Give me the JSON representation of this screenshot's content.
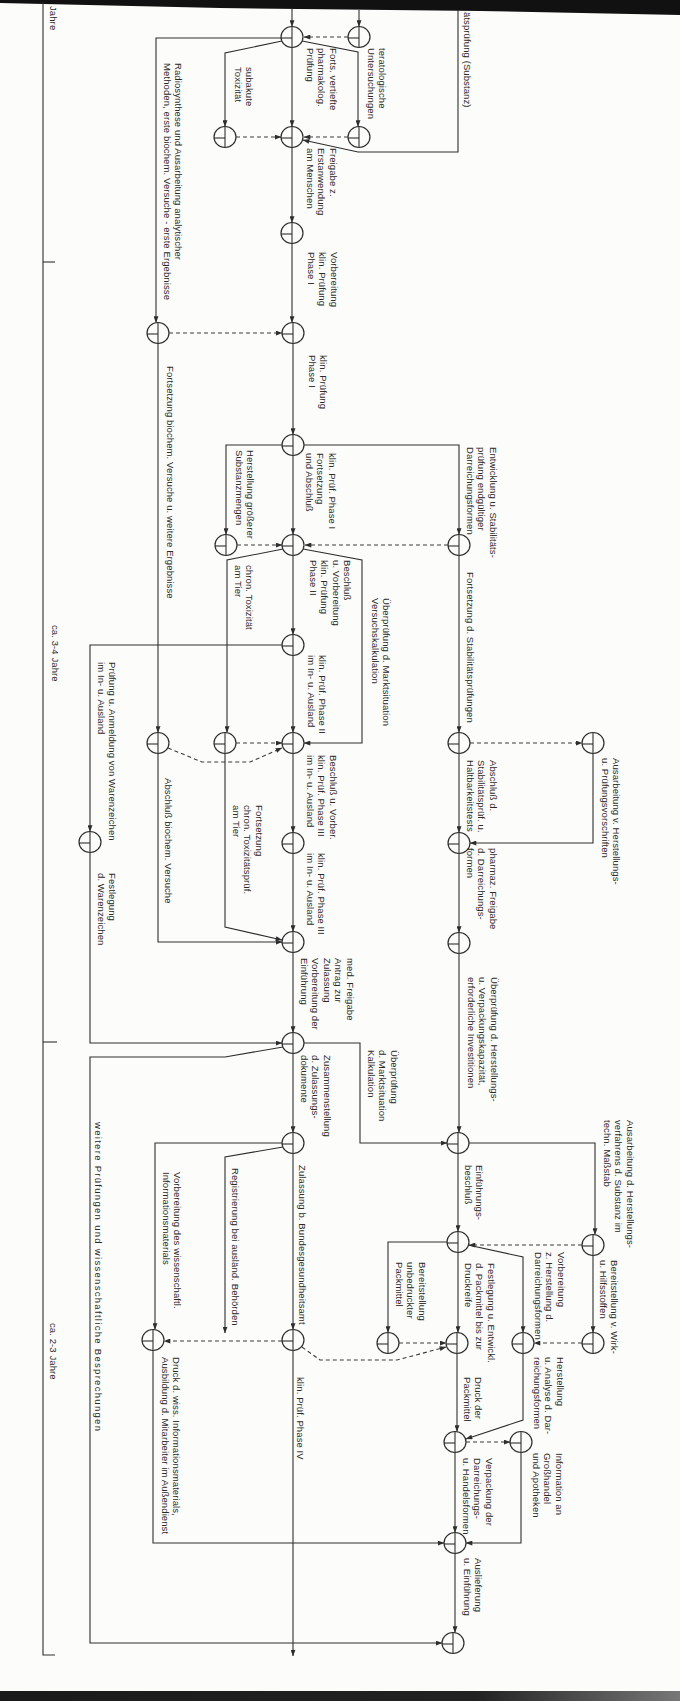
{
  "axis": {
    "unit_label": "Jahre",
    "period_1": "ca. 3-4 Jahre",
    "period_2": "ca. 2-3 Jahre"
  },
  "activities": [
    {
      "label": "ätsprüfung (Substanz)"
    },
    {
      "label": "teratologische\nUntersuchungen"
    },
    {
      "label": "Forts. vertiefte\npharmakolog.\nPrüfung"
    },
    {
      "label": "subakute\nToxizität"
    },
    {
      "label": "Radiosynthese und Ausarbeitung analytischer\nMethoden, erste biochem. Versuche - erste Ergebnisse"
    },
    {
      "label": "Freigabe z.\nErstanwendung\nam Menschen"
    },
    {
      "label": "Vorbereitung\nklin. Prüfung\nPhase I"
    },
    {
      "label": "klin. Prüfung\nPhase I"
    },
    {
      "label": "Fortsetzung biochem. Versuche u. weitere Ergebnisse"
    },
    {
      "label": "Entwicklung u. Stabilitäts-\nprüfung endgültiger\nDarreichungsformen"
    },
    {
      "label": "Herstellung größerer\nSubstanzmengen"
    },
    {
      "label": "klin. Prüf. Phase I\nFortsetzung\nund Abschluß"
    },
    {
      "label": "Fortsetzung d. Stabilitätsprüfungen"
    },
    {
      "label": "Beschluß\nu. Vorbereitung\nklin. Prüfung\nPhase II"
    },
    {
      "label": "Überprüfung d. Marktsituation\nVersuchskalkulation"
    },
    {
      "label": "chron. Toxizität\nam Tier"
    },
    {
      "label": "klin. Prüf. Phase II\nim In- u. Ausland"
    },
    {
      "label": "Prüfung u. Anmeldung von Warenzeichen\nim In- u. Ausland"
    },
    {
      "label": "Ausarbeitung v. Herstellungs-\nu. Prüfungsvorschriften"
    },
    {
      "label": "Abschluß d.\nStabilitätsprüf. u.\nHaltbarkeitstests"
    },
    {
      "label": "Beschluß u. Vorber.\nklin. Prüf. Phase III\nim In- u. Ausland"
    },
    {
      "label": "Abschluß biochem. Versuche"
    },
    {
      "label": "Fortsetzung\nchron. Toxizitätsprüf.\nam Tier"
    },
    {
      "label": "klin. Prüf. Phase III\nim In- u. Ausland"
    },
    {
      "label": "Festlegung\nd. Warenzeichen"
    },
    {
      "label": "pharmaz. Freigabe\nd. Darreichungs-\nformen"
    },
    {
      "label": "med. Freigabe\nAntrag zur\nZulassung\nVorbereitung der\nEinführung"
    },
    {
      "label": "Überprüfung d. Herstellungs-\nu. Verpackungskapazität,\nerforderliche Investitionen"
    },
    {
      "label": "Überprüfung\nd. Marktsituation\nKalkulation"
    },
    {
      "label": "Zusammenstellung\nd. Zulassungs-\ndokumente"
    },
    {
      "label": "Ausarbeitung d. Herstellungs-\nverfahrens d. Substanz im\ntechn. Maßstab"
    },
    {
      "label": "Einführungs-\nbeschluß"
    },
    {
      "label": "Vorbereitung des wissenschaftl.\nInformationsmaterials"
    },
    {
      "label": "Registrierung bei ausländ. Behörden"
    },
    {
      "label": "Zulassung b. Bundesgesundheitsamt"
    },
    {
      "label": "Vorbereitung\nz. Herstellung d.\nDarreichungsformen"
    },
    {
      "label": "Bereitstellung v. Wirk-\nu. Hilfsstoffen"
    },
    {
      "label": "Festlegung u. Entwickl.\nd. Packmittel bis zur\nDruckreife"
    },
    {
      "label": "Bereitstellung\nunbedruckter\nPackmittel"
    },
    {
      "label": "Herstellung\nu. Analyse d. Dar-\nreichungsformen"
    },
    {
      "label": "Druck der\nPackmittel"
    },
    {
      "label": "klin. Prüf. Phase IV"
    },
    {
      "label": "Druck d. wiss. Informationsmaterials,\nAusbildung d. Mitarbeiter im Außendienst"
    },
    {
      "label": "Information an\nGroßhandel\nund Apotheken"
    },
    {
      "label": "Verpackung der\nDarreichungs-\nu. Handelsformen"
    },
    {
      "label": "Auslieferung\nu. Einführung"
    },
    {
      "label": "weitere Prüfungen und wissenschaftliche Besprechungen"
    }
  ],
  "colors": {
    "ink": "#2e2e2e",
    "paper": "#fcfcfb",
    "scan_edge": "#111111"
  }
}
